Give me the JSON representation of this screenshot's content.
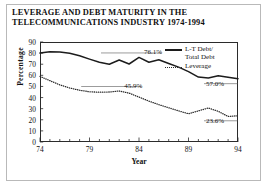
{
  "figure": {
    "title_line_1": "LEVERAGE AND DEBT MATURITY IN THE",
    "title_line_2": "TELECOMMUNICATIONS INDUSTRY 1974-1994"
  },
  "legend": {
    "series_1_line_1": "L-T Debt/",
    "series_1_line_2": "Total Debt",
    "series_2_line_1": "Leverage"
  },
  "chart_data": {
    "type": "line",
    "title": "LEVERAGE AND DEBT MATURITY IN THE TELECOMMUNICATIONS INDUSTRY 1974-1994",
    "xlabel": "Year",
    "ylabel": "Percentage",
    "xlim": [
      1974,
      1994
    ],
    "ylim": [
      0,
      90
    ],
    "ytick_values": [
      0,
      10,
      20,
      30,
      40,
      50,
      60,
      70,
      80,
      90
    ],
    "ytick_labels": [
      "0",
      "10",
      "20",
      "30",
      "40",
      "50",
      "60",
      "70",
      "80",
      "90"
    ],
    "xtick_values": [
      1974,
      1979,
      1984,
      1989,
      1994
    ],
    "xtick_labels": [
      "74",
      "79",
      "84",
      "89",
      "94"
    ],
    "minor_xticks": true,
    "grid": false,
    "legend_position": "upper right",
    "x": [
      1974,
      1975,
      1976,
      1977,
      1978,
      1979,
      1980,
      1981,
      1982,
      1983,
      1984,
      1985,
      1986,
      1987,
      1988,
      1989,
      1990,
      1991,
      1992,
      1993,
      1994
    ],
    "series": [
      {
        "name": "L-T Debt/Total Debt",
        "style": "solid",
        "color": "#1c1c1c",
        "values": [
          80.0,
          81.2,
          81.0,
          79.8,
          77.6,
          74.6,
          71.8,
          70.0,
          73.8,
          70.2,
          76.1,
          71.8,
          74.0,
          70.6,
          67.4,
          63.4,
          58.4,
          57.6,
          59.6,
          58.2,
          57.0
        ]
      },
      {
        "name": "Leverage",
        "style": "dotted",
        "color": "#2a2a2a",
        "values": [
          59.0,
          55.2,
          51.4,
          48.6,
          46.6,
          45.2,
          44.8,
          45.0,
          45.9,
          44.0,
          40.4,
          36.8,
          33.6,
          30.8,
          28.0,
          25.4,
          28.0,
          30.6,
          27.6,
          23.0,
          23.6
        ]
      }
    ],
    "annotations": [
      {
        "text": "76.1%",
        "x": 1984,
        "y": 76.1,
        "series": "L-T Debt/Total Debt"
      },
      {
        "text": "57.0%",
        "x": 1994,
        "y": 57.0,
        "series": "L-T Debt/Total Debt"
      },
      {
        "text": "45.9%",
        "x": 1982,
        "y": 45.9,
        "series": "Leverage"
      },
      {
        "text": "23.6%",
        "x": 1994,
        "y": 23.6,
        "series": "Leverage"
      }
    ]
  }
}
